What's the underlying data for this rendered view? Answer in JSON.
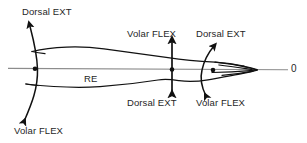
{
  "diagram": {
    "subject_label": "RE",
    "axis_origin_label": "0",
    "background_color": "#ffffff",
    "stroke_color": "#111111",
    "axis_color": "#8c8c8c",
    "labels": {
      "dorsal_ext_left": "Dorsal EXT",
      "volar_flex_left": "Volar FLEX",
      "volar_flex_mid": "Volar FLEX",
      "dorsal_ext_mid": "Dorsal EXT",
      "dorsal_ext_right": "Dorsal EXT",
      "volar_flex_right": "Volar FLEX"
    },
    "pivot_points": [
      {
        "name": "proximal-pivot",
        "x": 35,
        "y": 69
      },
      {
        "name": "mid-shaft-pivot",
        "x": 172,
        "y": 70
      },
      {
        "name": "distal-pivot",
        "x": 213,
        "y": 71
      }
    ],
    "arrows": [
      {
        "name": "proximal-rotation-arrow",
        "style": "curved-double-headed",
        "top_label": "Dorsal EXT",
        "bottom_label": "Volar FLEX"
      },
      {
        "name": "mid-shaft-rotation-arrow",
        "style": "straight-double-headed",
        "top_label": "Volar FLEX",
        "bottom_label": "Dorsal EXT"
      },
      {
        "name": "distal-rotation-arrow",
        "style": "curved-double-headed",
        "top_label": "Dorsal EXT",
        "bottom_label": "Volar FLEX"
      }
    ],
    "axis": {
      "name": "horizontal-reference-axis",
      "x_start": 8,
      "x_end": 288,
      "y": 69
    }
  }
}
